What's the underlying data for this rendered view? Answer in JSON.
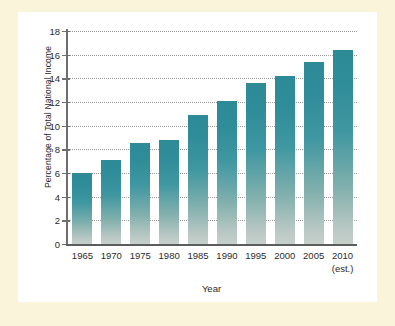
{
  "chart_data": {
    "type": "bar",
    "title": "",
    "xlabel": "Year",
    "ylabel": "Percentage of Total National Income",
    "categories": [
      "1965",
      "1970",
      "1975",
      "1980",
      "1985",
      "1990",
      "1995",
      "2000",
      "2005",
      "2010"
    ],
    "category_sublabels": [
      "",
      "",
      "",
      "",
      "",
      "",
      "",
      "",
      "",
      "(est.)"
    ],
    "values": [
      6.0,
      7.1,
      8.5,
      8.8,
      10.9,
      12.1,
      13.6,
      14.2,
      15.4,
      16.4
    ],
    "ylim": [
      0,
      18
    ],
    "ytick_values": [
      0,
      2,
      4,
      6,
      8,
      10,
      12,
      14,
      16,
      18
    ],
    "ytick_labels": [
      "0",
      "2",
      "4",
      "6",
      "8",
      "10",
      "12",
      "14",
      "16",
      "18"
    ],
    "grid": true,
    "grid_style": "dotted",
    "legend": null,
    "legend_position": "none",
    "bar_color_top": "#2d8b98",
    "bar_color_bottom": "#c6d0cb",
    "axis_color": "#5d5d5d",
    "grid_color": "#9a9a9a",
    "text_color": "#2b2b2b",
    "plot_background": "#ffffff",
    "page_background": "#f9f4da"
  }
}
